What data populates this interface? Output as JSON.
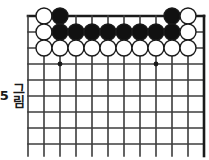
{
  "figure": {
    "caption_label": "그림",
    "caption_number": "5",
    "type": "go-board-diagram"
  },
  "board": {
    "columns": 12,
    "rows": 9,
    "cell_size": 16,
    "origin_x": 28,
    "origin_y": 16,
    "line_color": "#3c3c3c",
    "edge_color": "#1a1a1a",
    "line_width": 1.6,
    "edge_width": 2.6,
    "background": "#ffffff"
  },
  "star_points": [
    {
      "col": 3,
      "row": 4
    },
    {
      "col": 9,
      "row": 4
    }
  ],
  "stones": {
    "radius": 8,
    "black_fill": "#111111",
    "white_fill": "#ffffff",
    "outline": "#1a1a1a",
    "outline_width": 1.4,
    "list": [
      {
        "col": 2,
        "row": 1,
        "color": "white"
      },
      {
        "col": 3,
        "row": 1,
        "color": "black"
      },
      {
        "col": 10,
        "row": 1,
        "color": "black"
      },
      {
        "col": 11,
        "row": 1,
        "color": "white"
      },
      {
        "col": 2,
        "row": 2,
        "color": "white"
      },
      {
        "col": 3,
        "row": 2,
        "color": "black"
      },
      {
        "col": 4,
        "row": 2,
        "color": "black"
      },
      {
        "col": 5,
        "row": 2,
        "color": "black"
      },
      {
        "col": 6,
        "row": 2,
        "color": "black"
      },
      {
        "col": 7,
        "row": 2,
        "color": "black"
      },
      {
        "col": 8,
        "row": 2,
        "color": "black"
      },
      {
        "col": 9,
        "row": 2,
        "color": "black"
      },
      {
        "col": 10,
        "row": 2,
        "color": "black"
      },
      {
        "col": 11,
        "row": 2,
        "color": "white"
      },
      {
        "col": 2,
        "row": 3,
        "color": "white"
      },
      {
        "col": 3,
        "row": 3,
        "color": "white"
      },
      {
        "col": 4,
        "row": 3,
        "color": "white"
      },
      {
        "col": 5,
        "row": 3,
        "color": "white"
      },
      {
        "col": 6,
        "row": 3,
        "color": "white"
      },
      {
        "col": 7,
        "row": 3,
        "color": "white"
      },
      {
        "col": 8,
        "row": 3,
        "color": "white"
      },
      {
        "col": 9,
        "row": 3,
        "color": "white"
      },
      {
        "col": 10,
        "row": 3,
        "color": "white"
      },
      {
        "col": 11,
        "row": 3,
        "color": "white"
      }
    ]
  }
}
